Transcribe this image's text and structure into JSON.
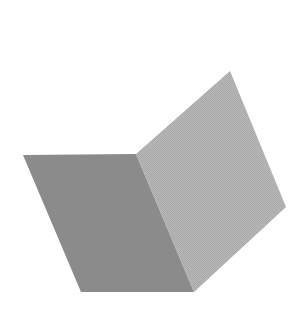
{
  "figure": {
    "width": 301,
    "height": 334,
    "background": "#ffffff",
    "faces": [
      {
        "name": "left-face",
        "fill": "#8f8f8f",
        "points": "23,155 136,154 194,292 81,292"
      },
      {
        "name": "right-face",
        "fill": "#b6b6b6",
        "points": "136,154 230,71 286,207 194,292"
      }
    ],
    "fold_edge": {
      "x1": 136,
      "y1": 154,
      "x2": 194,
      "y2": 292
    }
  }
}
